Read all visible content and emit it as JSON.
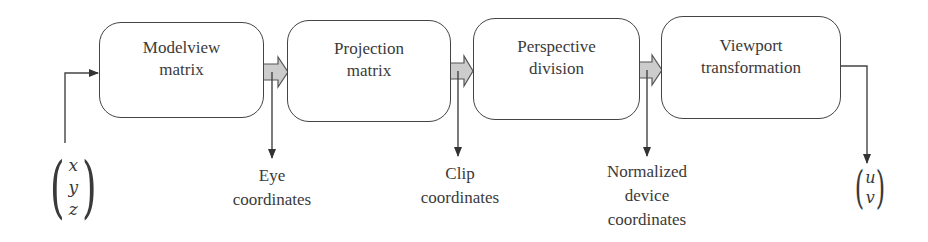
{
  "diagram": {
    "type": "pipeline-flowchart",
    "input_vector": {
      "label": "object coordinates",
      "components": [
        "x",
        "y",
        "z"
      ]
    },
    "stages": [
      {
        "id": "modelview",
        "line1": "Modelview",
        "line2": "matrix"
      },
      {
        "id": "projection",
        "line1": "Projection",
        "line2": "matrix"
      },
      {
        "id": "perspective",
        "line1": "Perspective",
        "line2": "division"
      },
      {
        "id": "viewport",
        "line1": "Viewport",
        "line2": "transformation"
      }
    ],
    "outputs": [
      {
        "id": "eye",
        "lines": [
          "Eye",
          "coordinates"
        ]
      },
      {
        "id": "clip",
        "lines": [
          "Clip",
          "coordinates"
        ]
      },
      {
        "id": "ndc",
        "lines": [
          "Normalized",
          "device",
          "coordinates"
        ]
      }
    ],
    "output_vector": {
      "components": [
        "u",
        "v"
      ]
    },
    "colors": {
      "stroke": "#444444",
      "block_arrow_fill": "#cccccc",
      "text": "#3a3a3a",
      "background": "#ffffff"
    }
  }
}
